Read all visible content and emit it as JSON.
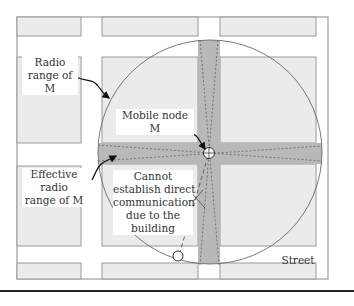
{
  "colors": {
    "background": "#ffffff",
    "building_fill": "#ebebeb",
    "building_stroke": "#9a9a9a",
    "effective_range_fill": "#b8b8b8",
    "range_circle_stroke": "#6a6a6a",
    "arrow": "#111111",
    "bottom_rule": "#222222"
  },
  "labels": {
    "radio_range": {
      "line1": "Radio",
      "line2": "range of",
      "line3": "M"
    },
    "mobile_node": {
      "line1": "Mobile node",
      "line2": "M"
    },
    "effective_range": {
      "line1": "Effective",
      "line2": "radio",
      "line3": "range of M"
    },
    "cannot_establish": {
      "line1": "Cannot",
      "line2": "establish direct",
      "line3": "communication",
      "line4": "due to the",
      "line5": "building"
    },
    "street": "Street"
  },
  "figure": {
    "mobile_node_symbol": "node-crosshair-circle",
    "remote_node_symbol": "empty-circle",
    "blocked_link": "dashed-line-with-x-mark"
  }
}
